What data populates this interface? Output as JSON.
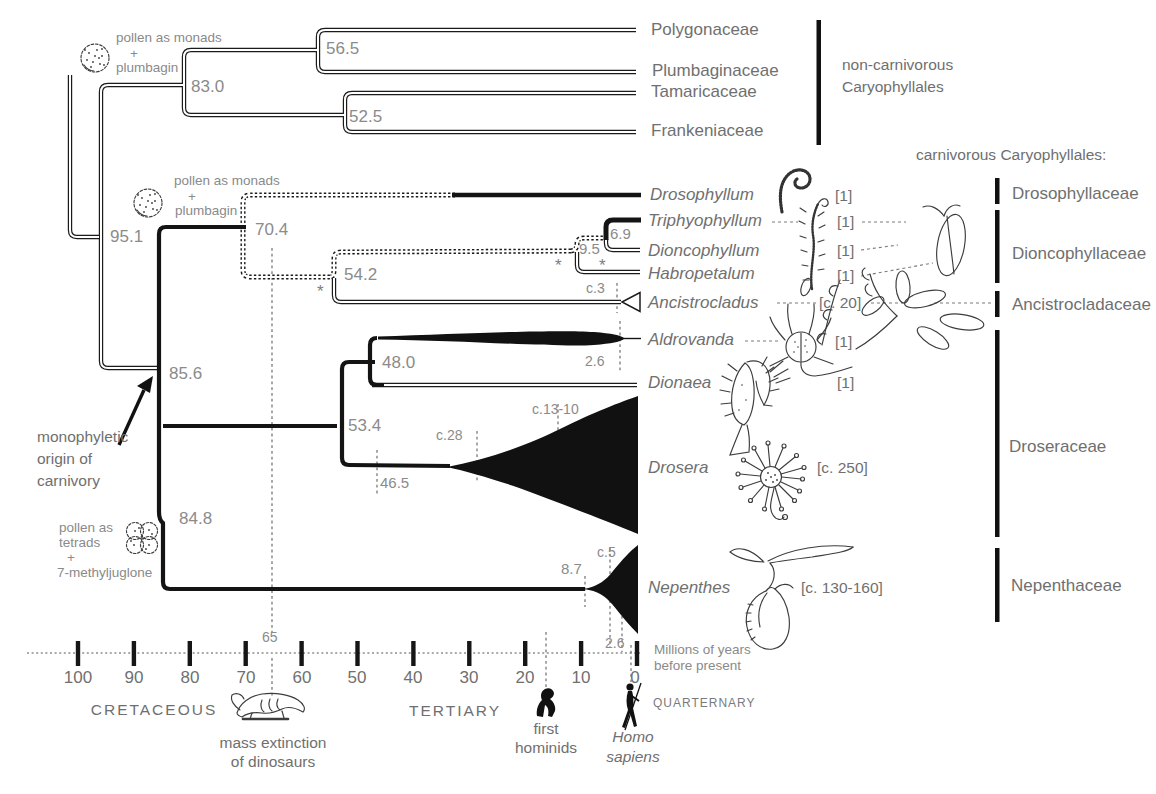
{
  "groups": {
    "non_carnivorous": [
      "non-carnivorous",
      "Caryophyllales"
    ],
    "carnivorous": "carnivorous Caryophyllales:"
  },
  "clade_annotations": {
    "pollen_monads_1": [
      "pollen as monads",
      "+",
      "plumbagin"
    ],
    "pollen_monads_2": [
      "pollen as monads",
      "+",
      "plumbagin"
    ],
    "pollen_tetrads": [
      "pollen as",
      "tetrads",
      "+",
      "7-methyljuglone"
    ],
    "carnivory_origin": [
      "monophyletic",
      "origin of",
      "carnivory"
    ],
    "asterisk": "*"
  },
  "node_ages": {
    "caryophyllales_root": "95.1",
    "noncarnivorous_crown": "83.0",
    "polygonaceae_plumbaginaceae": "56.5",
    "tamaricaceae_frankeniaceae": "52.5",
    "carnivorous_crown": "85.6",
    "drosophyllum_split": "70.4",
    "dioncophyllaceae_ancistrocladaceae": "54.2",
    "dioncophyllaceae_crown": "9.5",
    "triphyophyllum_dioncophyllum": "6.9",
    "ancistrocladus_crown": "c.3",
    "droseraceae_nepenthaceae": "84.8",
    "droseraceae_crown": "53.4",
    "aldrovanda_dionaea": "48.0",
    "aldrovanda_crown": "2.6",
    "drosera_stem": "46.5",
    "drosera_early": "c.28",
    "drosera_radiation": "c.13-10",
    "nepenthes_stem": "8.7",
    "nepenthes_crown": "c.5"
  },
  "tips_noncarnivorous": [
    "Polygonaceae",
    "Plumbaginaceae",
    "Tamaricaceae",
    "Frankeniaceae"
  ],
  "tips_carnivorous": [
    {
      "name": "Drosophyllum",
      "species_count": "[1]"
    },
    {
      "name": "Triphyophyllum",
      "species_count": "[1]"
    },
    {
      "name": "Dioncophyllum",
      "species_count": "[1]"
    },
    {
      "name": "Habropetalum",
      "species_count": "[1]"
    },
    {
      "name": "Ancistrocladus",
      "species_count": "[c. 20]"
    },
    {
      "name": "Aldrovanda",
      "species_count": "[1]"
    },
    {
      "name": "Dionaea",
      "species_count": "[1]"
    },
    {
      "name": "Drosera",
      "species_count": "[c. 250]"
    },
    {
      "name": "Nepenthes",
      "species_count": "[c. 130-160]"
    }
  ],
  "families": [
    "Drosophyllaceae",
    "Dioncophyllaceae",
    "Ancistrocladaceae",
    "Droseraceae",
    "Nepenthaceae"
  ],
  "timeline": {
    "tick_labels": [
      "100",
      "90",
      "80",
      "70",
      "60",
      "50",
      "40",
      "30",
      "20",
      "10",
      "0"
    ],
    "kt_boundary": "65",
    "quaternary_boundary": "2.6",
    "axis_title": [
      "Millions of years",
      "before present"
    ],
    "periods": {
      "cretaceous": "CRETACEOUS",
      "tertiary": "TERTIARY",
      "quaternary": "QUARTERNARY"
    },
    "events": {
      "mass_extinction": [
        "mass extinction",
        "of dinosaurs"
      ],
      "first_hominids": [
        "first",
        "hominids"
      ],
      "homo_sapiens": [
        "Homo",
        "sapiens"
      ]
    }
  }
}
